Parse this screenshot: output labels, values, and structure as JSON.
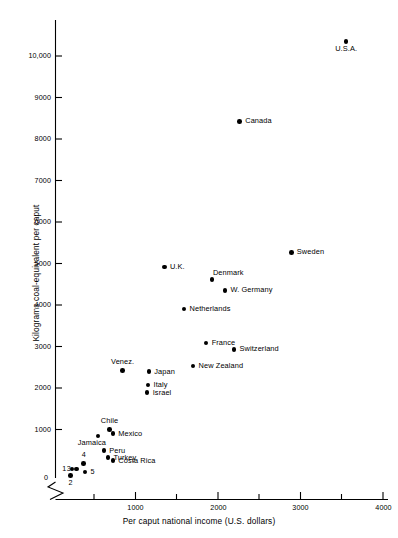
{
  "chart_data": {
    "type": "scatter",
    "title": "",
    "xlabel": "Per caput national income (U.S. dollars)",
    "ylabel": "Kilograms coal-equivalent per caput",
    "xlim": [
      0,
      4100
    ],
    "ylim": [
      0,
      10800
    ],
    "grid": false,
    "legend": "none",
    "x_ticks_major": [
      1000,
      2000,
      3000,
      4000
    ],
    "x_tick_labels": [
      "1000",
      "2000",
      "3000",
      "4000"
    ],
    "x_ticks_minor": [
      500,
      1500,
      2500,
      3500
    ],
    "y_ticks": [
      1000,
      2000,
      3000,
      4000,
      5000,
      6000,
      7000,
      8000,
      9000,
      10000
    ],
    "y_tick_labels": [
      "1000",
      "2000",
      "3000",
      "4000",
      "5000",
      "6000",
      "7000",
      "8000",
      "9000",
      "10,000"
    ],
    "origin_label": "0",
    "axis_break": "zigzag near origin on both axes",
    "points": [
      {
        "label": "U.S.A.",
        "x": 3550,
        "y": 10350,
        "label_pos": "below"
      },
      {
        "label": "Canada",
        "x": 2250,
        "y": 8450,
        "label_pos": "right"
      },
      {
        "label": "Sweden",
        "x": 2880,
        "y": 5350,
        "label_pos": "right"
      },
      {
        "label": "U.K.",
        "x": 1330,
        "y": 5000,
        "label_pos": "right"
      },
      {
        "label": "Denmark",
        "x": 1910,
        "y": 4700,
        "label_pos": "above-right"
      },
      {
        "label": "W. Germany",
        "x": 2070,
        "y": 4450,
        "label_pos": "right"
      },
      {
        "label": "Netherlands",
        "x": 1570,
        "y": 4000,
        "label_pos": "right"
      },
      {
        "label": "France",
        "x": 1840,
        "y": 3200,
        "label_pos": "right"
      },
      {
        "label": "Switzerland",
        "x": 2180,
        "y": 3050,
        "label_pos": "right"
      },
      {
        "label": "New Zealand",
        "x": 1680,
        "y": 2650,
        "label_pos": "right"
      },
      {
        "label": "Venez.",
        "x": 820,
        "y": 2550,
        "label_pos": "above"
      },
      {
        "label": "Japan",
        "x": 1140,
        "y": 2520,
        "label_pos": "right"
      },
      {
        "label": "Italy",
        "x": 1130,
        "y": 2200,
        "label_pos": "right"
      },
      {
        "label": "Israel",
        "x": 1120,
        "y": 2020,
        "label_pos": "right"
      },
      {
        "label": "Chile",
        "x": 660,
        "y": 1150,
        "label_pos": "above"
      },
      {
        "label": "Mexico",
        "x": 700,
        "y": 1050,
        "label_pos": "right"
      },
      {
        "label": "Jamaica",
        "x": 520,
        "y": 1000,
        "label_pos": "below-left"
      },
      {
        "label": "Peru",
        "x": 590,
        "y": 650,
        "label_pos": "right"
      },
      {
        "label": "Turkey",
        "x": 640,
        "y": 480,
        "label_pos": "right"
      },
      {
        "label": "Costa Rica",
        "x": 700,
        "y": 410,
        "label_pos": "right"
      },
      {
        "label": "1",
        "x": 200,
        "y": 215,
        "label_pos": "left"
      },
      {
        "label": "2",
        "x": 185,
        "y": 60,
        "label_pos": "below"
      },
      {
        "label": "3",
        "x": 255,
        "y": 210,
        "label_pos": "left"
      },
      {
        "label": "4",
        "x": 345,
        "y": 350,
        "label_pos": "above"
      },
      {
        "label": "5",
        "x": 360,
        "y": 140,
        "label_pos": "right"
      }
    ]
  },
  "axes": {
    "x_title": "Per caput national income (U.S. dollars)",
    "y_title": "Kilograms coal-equivalent per caput",
    "origin": "0",
    "x_labels": [
      "1000",
      "2000",
      "3000",
      "4000"
    ],
    "y_labels": [
      "1000",
      "2000",
      "3000",
      "4000",
      "5000",
      "6000",
      "7000",
      "8000",
      "9000",
      "10,000"
    ]
  },
  "caption_ghost": ""
}
